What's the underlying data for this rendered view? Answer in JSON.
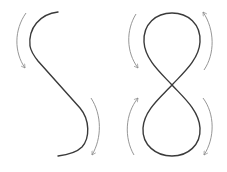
{
  "diagram": {
    "colors": {
      "curve": "#3a3a3a",
      "arrow": "#8a8a8a",
      "background": "#ffffff"
    },
    "shapes": [
      {
        "name": "s-curve",
        "arrows": [
          {
            "position": "left-top",
            "direction": "down"
          },
          {
            "position": "right-bottom",
            "direction": "down"
          }
        ]
      },
      {
        "name": "figure-eight",
        "arrows": [
          {
            "position": "left-top",
            "direction": "down"
          },
          {
            "position": "right-top",
            "direction": "up"
          },
          {
            "position": "left-bottom",
            "direction": "up"
          },
          {
            "position": "right-bottom",
            "direction": "down"
          }
        ]
      }
    ]
  }
}
